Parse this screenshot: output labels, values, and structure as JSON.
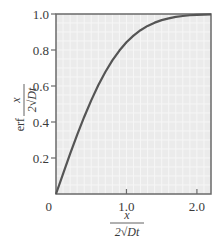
{
  "chart_data": {
    "type": "line",
    "title": "",
    "xlabel": "x / (2√(Dt))",
    "ylabel": "erf x / (2√(Dt))",
    "xlim": [
      0,
      2.2
    ],
    "ylim": [
      0,
      1.0
    ],
    "x_ticks": [
      0,
      1.0,
      2.0
    ],
    "x_tick_labels": [
      "0",
      "1.0",
      "2.0"
    ],
    "y_ticks": [
      0.2,
      0.4,
      0.6,
      0.8,
      1.0
    ],
    "y_tick_labels": [
      "0.2",
      "0.4",
      "0.6",
      "0.8",
      "1.0"
    ],
    "origin_label": "0",
    "grid": true,
    "legend": null,
    "series": [
      {
        "name": "erf",
        "x": [
          0,
          0.1,
          0.2,
          0.3,
          0.4,
          0.5,
          0.6,
          0.7,
          0.8,
          0.9,
          1.0,
          1.1,
          1.2,
          1.3,
          1.4,
          1.5,
          1.6,
          1.7,
          1.8,
          1.9,
          2.0,
          2.1,
          2.2
        ],
        "values": [
          0,
          0.112,
          0.223,
          0.329,
          0.428,
          0.52,
          0.604,
          0.678,
          0.742,
          0.797,
          0.843,
          0.88,
          0.91,
          0.934,
          0.952,
          0.966,
          0.976,
          0.984,
          0.989,
          0.993,
          0.995,
          0.997,
          0.998
        ]
      }
    ],
    "colors": {
      "plot_background": "#ebebeb",
      "grid": "#f6f6f6",
      "curve": "#555555",
      "frame": "#6a6a6a"
    }
  },
  "labels": {
    "x_numerator": "x",
    "x_denominator": "2√Dt",
    "y_prefix": "erf",
    "y_numerator": "x",
    "y_denominator": "2√Dt"
  }
}
